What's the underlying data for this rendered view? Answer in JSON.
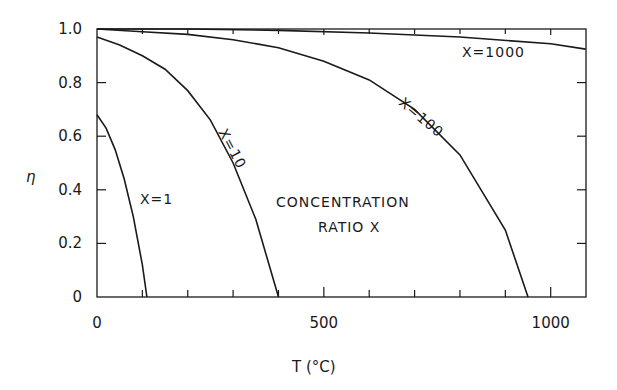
{
  "chart_data": {
    "type": "line",
    "title": "",
    "xlabel": "T (°C)",
    "ylabel": "η",
    "xlim": [
      0,
      1077
    ],
    "ylim": [
      0,
      1.0
    ],
    "xticks": [
      0,
      500,
      1000
    ],
    "yticks": [
      "0",
      "0.2",
      "0.4",
      "0.6",
      "0.8",
      "1.0"
    ],
    "grid": false,
    "annotation": [
      "CONCENTRATION",
      "RATIO X"
    ],
    "series": [
      {
        "name": "X=1",
        "x": [
          0,
          20,
          40,
          60,
          80,
          100,
          110
        ],
        "y": [
          0.68,
          0.63,
          0.55,
          0.44,
          0.3,
          0.12,
          0.0
        ]
      },
      {
        "name": "X=10",
        "x": [
          0,
          50,
          100,
          150,
          200,
          250,
          300,
          350,
          400
        ],
        "y": [
          0.97,
          0.94,
          0.9,
          0.85,
          0.77,
          0.66,
          0.5,
          0.29,
          0.0
        ]
      },
      {
        "name": "X=100",
        "x": [
          0,
          100,
          200,
          300,
          400,
          500,
          600,
          700,
          800,
          900,
          950
        ],
        "y": [
          1.0,
          0.99,
          0.98,
          0.96,
          0.93,
          0.88,
          0.81,
          0.7,
          0.53,
          0.25,
          0.0
        ]
      },
      {
        "name": "X=1000",
        "x": [
          0,
          200,
          400,
          600,
          800,
          1000,
          1077
        ],
        "y": [
          1.0,
          1.0,
          0.995,
          0.985,
          0.97,
          0.945,
          0.925
        ]
      }
    ]
  },
  "labels": {
    "x1": "X=1",
    "x10": "X=10",
    "x100": "X=100",
    "x1000": "X=1000",
    "ann1": "CONCENTRATION",
    "ann2": "RATIO X",
    "xlabel": "T (°C)",
    "ylabel": "η"
  }
}
